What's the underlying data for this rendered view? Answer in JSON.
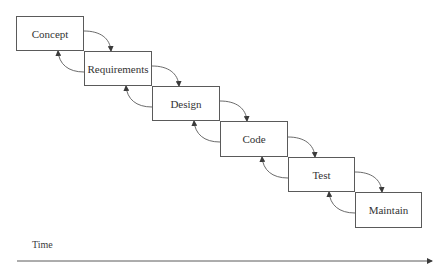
{
  "diagram": {
    "type": "waterfall-model",
    "stages": [
      {
        "label": "Concept",
        "x": 16,
        "y": 16,
        "w": 68,
        "h": 35
      },
      {
        "label": "Requirements",
        "x": 84,
        "y": 51,
        "w": 68,
        "h": 35
      },
      {
        "label": "Design",
        "x": 152,
        "y": 86,
        "w": 68,
        "h": 35
      },
      {
        "label": "Code",
        "x": 220,
        "y": 121,
        "w": 68,
        "h": 36
      },
      {
        "label": "Test",
        "x": 288,
        "y": 157,
        "w": 67,
        "h": 35
      },
      {
        "label": "Maintain",
        "x": 355,
        "y": 192,
        "w": 67,
        "h": 36
      }
    ],
    "axis": {
      "label": "Time",
      "direction": "right"
    },
    "colors": {
      "stroke": "#5a5a5a",
      "text": "#333333",
      "background": "#ffffff"
    }
  }
}
